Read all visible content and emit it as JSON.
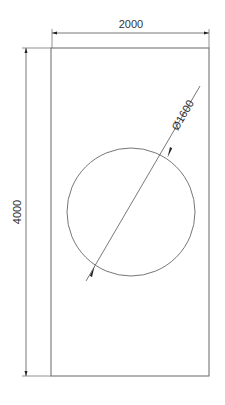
{
  "drawing": {
    "type": "technical-drawing",
    "plate": {
      "shape": "rectangle",
      "width_label": "2000",
      "height_label": "4000"
    },
    "hole": {
      "shape": "circle",
      "diameter_label": "Ø1600"
    },
    "colors": {
      "line": "#555555",
      "text": "#333333",
      "background": "#ffffff"
    }
  }
}
